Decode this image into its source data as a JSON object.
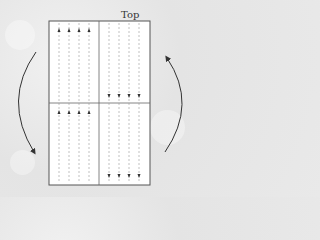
{
  "labels": {
    "top": "Top"
  },
  "colors": {
    "background": "#e6e6e6",
    "box_fill": "#ffffff",
    "box_stroke": "#555555",
    "dashed_line": "#999999",
    "arrow": "#333333"
  },
  "diagram": {
    "box": {
      "x": 49,
      "y": 21,
      "width": 101,
      "height": 164
    },
    "divider_vertical_x": 99,
    "divider_horizontal_y": 103,
    "left_columns": {
      "x": [
        59,
        69,
        79,
        89
      ],
      "arrow_direction": "up",
      "arrow_y": [
        30,
        112
      ]
    },
    "right_columns": {
      "x": [
        109,
        119,
        129,
        139
      ],
      "arrow_direction": "down",
      "arrow_y": [
        96,
        176
      ]
    },
    "rotation_arrows": [
      {
        "side": "left",
        "direction": "counterclockwise-down",
        "arrowhead": "bottom"
      },
      {
        "side": "right",
        "direction": "up",
        "arrowhead": "top"
      }
    ]
  }
}
